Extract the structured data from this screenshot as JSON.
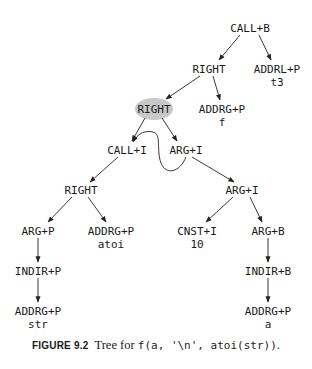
{
  "diagram": {
    "title": "Tree for f(a, '\\n', atoi(str))",
    "nodes": [
      {
        "id": "n1",
        "op": "CALL+B",
        "arg": "",
        "highlight": false
      },
      {
        "id": "n2",
        "op": "RIGHT",
        "arg": "",
        "highlight": false
      },
      {
        "id": "n3",
        "op": "ADDRL+P",
        "arg": "t3",
        "highlight": false
      },
      {
        "id": "n4",
        "op": "RIGHT",
        "arg": "",
        "highlight": true
      },
      {
        "id": "n5",
        "op": "ADDRG+P",
        "arg": "f",
        "highlight": false
      },
      {
        "id": "n6",
        "op": "CALL+I",
        "arg": "",
        "highlight": false
      },
      {
        "id": "n7",
        "op": "ARG+I",
        "arg": "",
        "highlight": false
      },
      {
        "id": "n8",
        "op": "RIGHT",
        "arg": "",
        "highlight": false
      },
      {
        "id": "n9",
        "op": "ARG+I",
        "arg": "",
        "highlight": false
      },
      {
        "id": "n10",
        "op": "ARG+P",
        "arg": "",
        "highlight": false
      },
      {
        "id": "n11",
        "op": "ADDRG+P",
        "arg": "atoi",
        "highlight": false
      },
      {
        "id": "n12",
        "op": "CNST+I",
        "arg": "10",
        "highlight": false
      },
      {
        "id": "n13",
        "op": "ARG+B",
        "arg": "",
        "highlight": false
      },
      {
        "id": "n14",
        "op": "INDIR+P",
        "arg": "",
        "highlight": false
      },
      {
        "id": "n15",
        "op": "INDIR+B",
        "arg": "",
        "highlight": false
      },
      {
        "id": "n16",
        "op": "ADDRG+P",
        "arg": "str",
        "highlight": false
      },
      {
        "id": "n17",
        "op": "ADDRG+P",
        "arg": "a",
        "highlight": false
      }
    ],
    "edges": [
      {
        "from": "n1",
        "to": "n2"
      },
      {
        "from": "n1",
        "to": "n3"
      },
      {
        "from": "n2",
        "to": "n4"
      },
      {
        "from": "n2",
        "to": "n5"
      },
      {
        "from": "n4",
        "to": "n6"
      },
      {
        "from": "n4",
        "to": "n7"
      },
      {
        "from": "n6",
        "to": "n8"
      },
      {
        "from": "n7",
        "to": "n9"
      },
      {
        "from": "n8",
        "to": "n10"
      },
      {
        "from": "n8",
        "to": "n11"
      },
      {
        "from": "n9",
        "to": "n12"
      },
      {
        "from": "n9",
        "to": "n13"
      },
      {
        "from": "n10",
        "to": "n14"
      },
      {
        "from": "n13",
        "to": "n15"
      },
      {
        "from": "n14",
        "to": "n16"
      },
      {
        "from": "n15",
        "to": "n17"
      },
      {
        "from": "n7",
        "to": "n6",
        "style": "curved"
      }
    ],
    "highlight_color": "#c8c8c8"
  },
  "caption": {
    "figure_label": "FIGURE 9.2",
    "text": "Tree for ",
    "code": "f(a, '\\n', atoi(str))",
    "end": "."
  }
}
